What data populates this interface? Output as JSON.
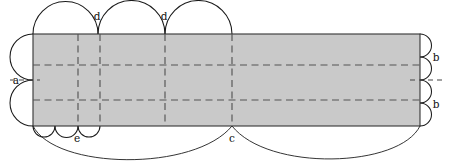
{
  "figure": {
    "title": "",
    "type": "geometric-net-diagram",
    "canvas": {
      "width": 450,
      "height": 164
    },
    "colors": {
      "panel_fill": "#c9c9c9",
      "outline": "#333333",
      "arc": "#1a1a1a",
      "dash": "#555555",
      "background": "#ffffff"
    },
    "panel": {
      "name": "central-rectangle",
      "x": 33,
      "y": 34,
      "width": 387,
      "height": 92
    },
    "labels": [
      {
        "id": "a",
        "text": "a",
        "x": 16,
        "y": 82,
        "describes": "left-edge-arc-radius"
      },
      {
        "id": "d1",
        "text": "d",
        "x": 97,
        "y": 19,
        "describes": "top-edge-arc-junction"
      },
      {
        "id": "d2",
        "text": "d",
        "x": 164,
        "y": 19,
        "describes": "top-edge-arc-junction"
      },
      {
        "id": "b1",
        "text": "b",
        "x": 435,
        "y": 58,
        "describes": "right-edge-arc-radius"
      },
      {
        "id": "b2",
        "text": "b",
        "x": 435,
        "y": 105,
        "describes": "right-edge-arc-radius"
      },
      {
        "id": "e",
        "text": "e",
        "x": 77,
        "y": 140,
        "describes": "bottom-small-arc-junction"
      },
      {
        "id": "c",
        "text": "c",
        "x": 232,
        "y": 140,
        "describes": "bottom-large-arc-junction"
      }
    ],
    "arcs": {
      "top": {
        "name": "top-semicircles",
        "count": 3,
        "label": "d",
        "junction_x": [
          98,
          165,
          232
        ],
        "start_x": 33,
        "end_x": 232,
        "baseline_y": 34
      },
      "left": {
        "name": "left-semicircles",
        "count": 2,
        "label": "a",
        "junction_y": [
          34,
          80,
          126
        ],
        "baseline_x": 33
      },
      "right": {
        "name": "right-semicircles",
        "count": 4,
        "label": "b",
        "junction_y": [
          34,
          57,
          80,
          103,
          126
        ],
        "baseline_x": 420
      },
      "bottom_small": {
        "name": "bottom-small-semicircles",
        "count": 3,
        "label": "e",
        "junction_x": [
          33,
          55,
          78,
          100
        ],
        "baseline_y": 126
      },
      "bottom_large": {
        "name": "bottom-large-arcs",
        "count": 2,
        "label": "c",
        "junction_x": [
          33,
          232,
          420
        ],
        "baseline_y": 126
      }
    },
    "fold_lines": {
      "vertical_x": [
        78,
        100,
        165,
        232
      ],
      "horizontal_y": [
        65,
        100
      ]
    },
    "tick_marks": {
      "left_a": {
        "x1": 10,
        "x2": 40,
        "y": 80
      },
      "right_mid": {
        "x1": 412,
        "x2": 442,
        "y": 80
      }
    }
  }
}
